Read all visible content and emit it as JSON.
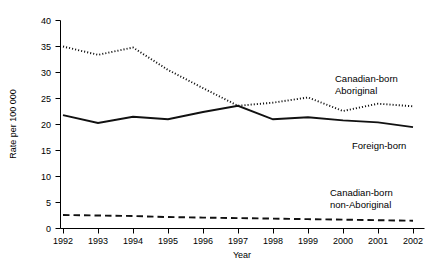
{
  "chart_data": {
    "type": "line",
    "title": "",
    "xlabel": "Year",
    "ylabel": "Rate per 100 000",
    "x": [
      1992,
      1993,
      1994,
      1995,
      1996,
      1997,
      1998,
      1999,
      2000,
      2001,
      2002
    ],
    "xtick_labels": [
      "1992",
      "1993",
      "1994",
      "1995",
      "1996",
      "1997",
      "1998",
      "1999",
      "2000",
      "2001",
      "2002"
    ],
    "ytick_labels": [
      "0",
      "5",
      "10",
      "15",
      "20",
      "25",
      "30",
      "35",
      "40"
    ],
    "yticks": [
      0,
      5,
      10,
      15,
      20,
      25,
      30,
      35,
      40
    ],
    "ylim": [
      0,
      40
    ],
    "xlim": [
      1992,
      2002
    ],
    "grid": false,
    "legend_position": "inline-right",
    "series": [
      {
        "name": "Canadian-born Aboriginal",
        "style": "dotted",
        "color": "#111111",
        "label_lines": [
          "Canadian-born",
          "Aboriginal"
        ],
        "values": [
          35.0,
          33.4,
          34.8,
          30.5,
          27.0,
          23.6,
          24.2,
          25.2,
          22.6,
          24.0,
          23.5
        ]
      },
      {
        "name": "Foreign-born",
        "style": "solid",
        "color": "#111111",
        "label_lines": [
          "Foreign-born"
        ],
        "values": [
          21.8,
          20.3,
          21.5,
          21.0,
          22.4,
          23.6,
          21.0,
          21.4,
          20.8,
          20.4,
          19.5
        ]
      },
      {
        "name": "Canadian-born non-Aboriginal",
        "style": "dashed",
        "color": "#111111",
        "label_lines": [
          "Canadian-born",
          "non-Aboriginal"
        ],
        "values": [
          2.6,
          2.5,
          2.4,
          2.2,
          2.1,
          2.0,
          1.9,
          1.8,
          1.7,
          1.6,
          1.5
        ]
      }
    ],
    "annotations": [
      {
        "id": "label-aboriginal",
        "text_lines": [
          "Canadian-born",
          "Aboriginal"
        ],
        "x": 335,
        "y": 82
      },
      {
        "id": "label-foreign-born",
        "text_lines": [
          "Foreign-born"
        ],
        "x": 352,
        "y": 146
      },
      {
        "id": "label-non-aboriginal",
        "text_lines": [
          "Canadian-born",
          "non-Aboriginal"
        ],
        "x": 330,
        "y": 196
      }
    ]
  }
}
